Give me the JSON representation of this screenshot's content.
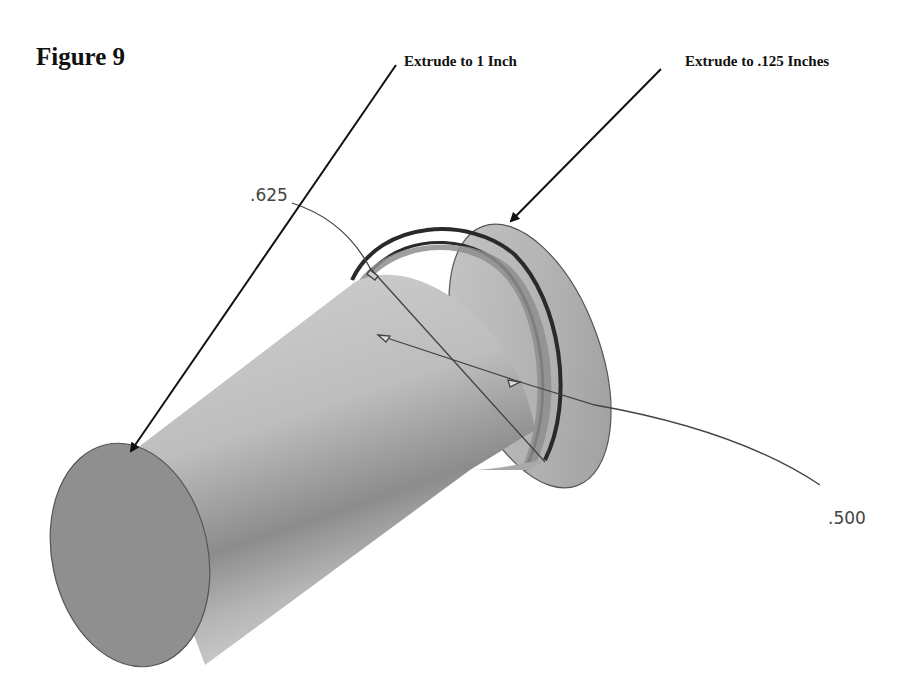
{
  "figure": {
    "title": "Figure 9"
  },
  "callouts": [
    {
      "label": "Extrude to 1 Inch",
      "target": "main-cylinder"
    },
    {
      "label": "Extrude to .125 Inches",
      "target": "flange"
    }
  ],
  "dimensions": [
    {
      "label": ".625",
      "refers_to": "flange diameter"
    },
    {
      "label": ".500",
      "refers_to": "shaft diameter"
    }
  ],
  "colors": {
    "background": "#ffffff",
    "face_fill": "#8f8f8f",
    "body_light": "#c9c9c9",
    "body_dark": "#8a8a8a",
    "edge": "#3a3a3a",
    "leader": "#111111"
  }
}
